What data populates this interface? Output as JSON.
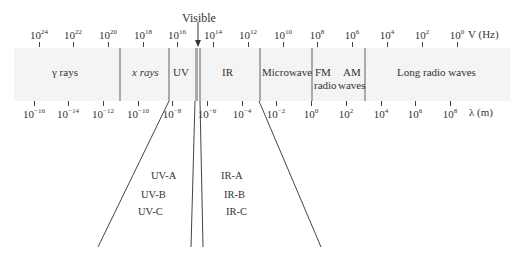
{
  "diagram": {
    "frequency_axis": {
      "unit_label": "V (Hz)",
      "ticks": [
        {
          "base": "10",
          "exp": "24",
          "x": 39
        },
        {
          "base": "10",
          "exp": "22",
          "x": 73
        },
        {
          "base": "10",
          "exp": "20",
          "x": 108
        },
        {
          "base": "10",
          "exp": "18",
          "x": 143
        },
        {
          "base": "10",
          "exp": "16",
          "x": 177
        },
        {
          "base": "10",
          "exp": "14",
          "x": 213
        },
        {
          "base": "10",
          "exp": "12",
          "x": 248
        },
        {
          "base": "10",
          "exp": "10",
          "x": 283
        },
        {
          "base": "10",
          "exp": "8",
          "x": 317
        },
        {
          "base": "10",
          "exp": "6",
          "x": 352
        },
        {
          "base": "10",
          "exp": "4",
          "x": 387
        },
        {
          "base": "10",
          "exp": "2",
          "x": 422
        },
        {
          "base": "10",
          "exp": "0",
          "x": 457
        }
      ]
    },
    "wavelength_axis": {
      "unit_label": "λ (m)",
      "ticks": [
        {
          "base": "10",
          "exp": "−16",
          "x": 34
        },
        {
          "base": "10",
          "exp": "−14",
          "x": 68
        },
        {
          "base": "10",
          "exp": "−12",
          "x": 103
        },
        {
          "base": "10",
          "exp": "−10",
          "x": 138
        },
        {
          "base": "10",
          "exp": "−8",
          "x": 172
        },
        {
          "base": "10",
          "exp": "−6",
          "x": 207
        },
        {
          "base": "10",
          "exp": "−4",
          "x": 242
        },
        {
          "base": "10",
          "exp": "−2",
          "x": 276
        },
        {
          "base": "10",
          "exp": "0",
          "x": 311
        },
        {
          "base": "10",
          "exp": "2",
          "x": 346
        },
        {
          "base": "10",
          "exp": "4",
          "x": 381
        },
        {
          "base": "10",
          "exp": "6",
          "x": 415
        },
        {
          "base": "10",
          "exp": "8",
          "x": 450
        }
      ]
    },
    "visible_label": "Visible",
    "regions": [
      {
        "name": "gamma",
        "label": "γ rays"
      },
      {
        "name": "xray",
        "label": "x rays"
      },
      {
        "name": "uv",
        "label": "UV"
      },
      {
        "name": "ir",
        "label": "IR"
      },
      {
        "name": "microwave",
        "label": "Microwave"
      },
      {
        "name": "fm",
        "label": "FM"
      },
      {
        "name": "fm2",
        "label": "radio"
      },
      {
        "name": "am",
        "label": "AM"
      },
      {
        "name": "am2",
        "label": "waves"
      },
      {
        "name": "long",
        "label": "Long radio waves"
      }
    ],
    "uv_subbands": [
      "UV-A",
      "UV-B",
      "UV-C"
    ],
    "ir_subbands": [
      "IR-A",
      "IR-B",
      "IR-C"
    ],
    "colors": {
      "band_bg": "#f4f4f4",
      "divider": "#aaaaaa",
      "text": "#333333"
    }
  }
}
